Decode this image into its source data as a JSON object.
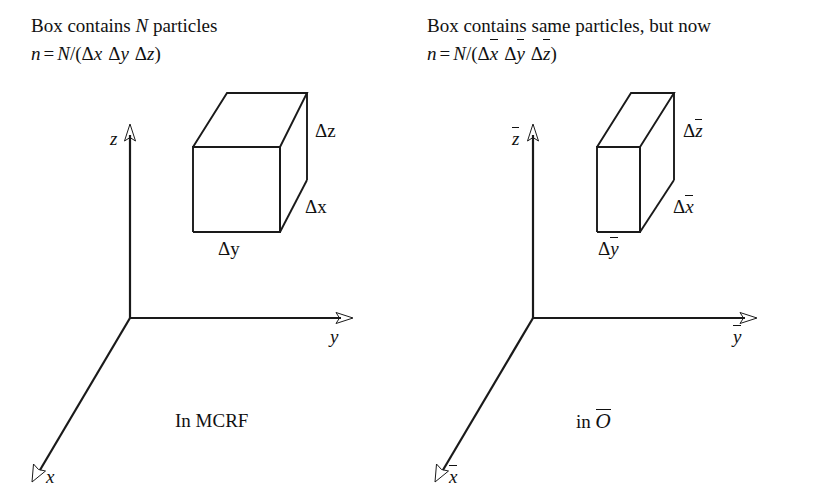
{
  "figure": {
    "type": "diagram",
    "background_color": "#ffffff",
    "stroke_color": "#1a1a1a",
    "width": 821,
    "height": 500
  },
  "left_panel": {
    "caption_line1_pre": "Box contains ",
    "caption_line1_var": "N",
    "caption_line1_post": " particles",
    "caption_line2": {
      "lhs": "n",
      "equals": "=",
      "numerator": "N",
      "slash": "/(",
      "term1_delta": "Δ",
      "term1_var": "x",
      "term2_delta": "Δ",
      "term2_var": "y",
      "term3_delta": "Δ",
      "term3_var": "z",
      "close": ")"
    },
    "axes": {
      "z_label": "z",
      "y_label": "y",
      "x_label": "x"
    },
    "box_dims": {
      "delta_z": "Δz",
      "delta_x": "Δx",
      "delta_y": "Δy"
    },
    "frame_label": "In MCRF"
  },
  "right_panel": {
    "caption_line1": "Box contains same particles, but now",
    "caption_line2": {
      "lhs": "n",
      "equals": "=",
      "numerator": "N",
      "slash": "/(",
      "term1_delta": "Δ",
      "term1_var": "x",
      "term2_delta": "Δ",
      "term2_var": "y",
      "term3_delta": "Δ",
      "term3_var": "z",
      "close": ")"
    },
    "axes": {
      "z_label": "z",
      "y_label": "y",
      "x_label": "x"
    },
    "box_dims": {
      "delta_z_delta": "Δ",
      "delta_z_var": "z",
      "delta_x_delta": "Δ",
      "delta_x_var": "x",
      "delta_y_delta": "Δ",
      "delta_y_var": "y"
    },
    "frame_label_pre": "in ",
    "frame_label_var": "O"
  }
}
